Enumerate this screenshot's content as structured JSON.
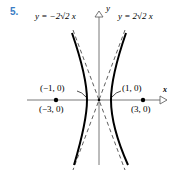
{
  "problem_number": "5.",
  "axes": {
    "x_label": "x",
    "y_label": "y"
  },
  "asymptotes": [
    {
      "label": "y = −2√2 x",
      "slope": -2.828
    },
    {
      "label": "y = 2√2 x",
      "slope": 2.828
    }
  ],
  "points": [
    {
      "label": "(−1, 0)",
      "x": -1,
      "y": 0,
      "type": "vertex"
    },
    {
      "label": "(1, 0)",
      "x": 1,
      "y": 0,
      "type": "vertex"
    },
    {
      "label": "(−3, 0)",
      "x": -3,
      "y": 0,
      "type": "focus"
    },
    {
      "label": "(3, 0)",
      "x": 3,
      "y": 0,
      "type": "focus"
    }
  ],
  "curve": "hyperbola x^2 - y^2/8 = 1",
  "colors": {
    "number": "#3a7cc4",
    "ink": "#000000"
  }
}
